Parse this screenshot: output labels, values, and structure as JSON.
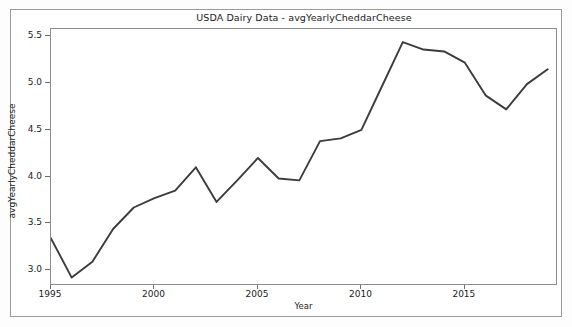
{
  "figure": {
    "title": "USDA Dairy Data - avgYearlyCheddarCheese",
    "background_color": "#ffffff",
    "line_color": "#3c3c3c",
    "axis_color": "#8d8d8d"
  },
  "axes": {
    "x_title": "Year",
    "y_title": "avgYearlyCheddarCheese",
    "x_ticks": [
      "1995",
      "2000",
      "2005",
      "2010",
      "2015"
    ],
    "y_ticks": [
      "3.0",
      "3.5",
      "4.0",
      "4.5",
      "5.0",
      "5.5"
    ]
  },
  "chart_data": {
    "type": "line",
    "title": "USDA Dairy Data - avgYearlyCheddarCheese",
    "xlabel": "Year",
    "ylabel": "avgYearlyCheddarCheese",
    "xlim": [
      1995,
      2019.5
    ],
    "ylim": [
      2.83,
      5.58
    ],
    "grid": false,
    "legend": null,
    "xticks": [
      1995,
      2000,
      2005,
      2010,
      2015
    ],
    "yticks": [
      3.0,
      3.5,
      4.0,
      4.5,
      5.0,
      5.5
    ],
    "x": [
      1995,
      1996,
      1997,
      1998,
      1999,
      2000,
      2001,
      2002,
      2003,
      2004,
      2005,
      2006,
      2007,
      2008,
      2009,
      2010,
      2011,
      2012,
      2013,
      2014,
      2015,
      2016,
      2017,
      2018,
      2019
    ],
    "series": [
      {
        "name": "avgYearlyCheddarCheese",
        "values": [
          3.34,
          2.92,
          3.09,
          3.44,
          3.67,
          3.77,
          3.85,
          4.1,
          3.73,
          3.96,
          4.2,
          3.98,
          3.96,
          4.38,
          4.41,
          4.5,
          4.97,
          5.44,
          5.36,
          5.34,
          5.22,
          4.87,
          4.72,
          4.99,
          5.15
        ]
      }
    ]
  }
}
